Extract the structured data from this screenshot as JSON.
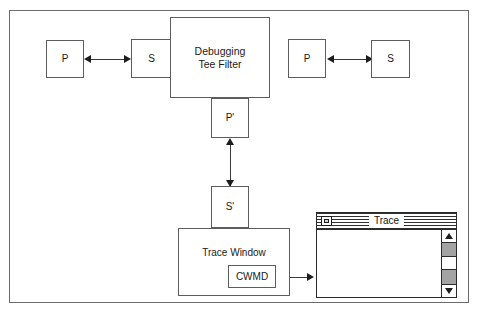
{
  "diagram": {
    "nodes": {
      "client_proxy": {
        "label": "P"
      },
      "client_stub": {
        "label": "S"
      },
      "tee_filter": {
        "line1": "Debugging",
        "line2": "Tee Filter"
      },
      "server_proxy": {
        "label": "P"
      },
      "server_stub": {
        "label": "S"
      },
      "trace_proxy": {
        "label": "P'"
      },
      "trace_stub": {
        "label": "S'"
      },
      "trace_window": {
        "label": "Trace Window"
      },
      "cwmd": {
        "label": "CWMD"
      }
    },
    "connectors": [
      {
        "name": "p-to-s-left",
        "kind": "double-arrow",
        "orientation": "horizontal"
      },
      {
        "name": "p-to-s-right",
        "kind": "double-arrow",
        "orientation": "horizontal"
      },
      {
        "name": "pprime-to-sprime",
        "kind": "double-arrow",
        "orientation": "vertical"
      },
      {
        "name": "cwmd-to-trace",
        "kind": "single-arrow",
        "orientation": "horizontal"
      }
    ],
    "colors": {
      "frame": "#6b6b6b",
      "box_border": "#5d5d5d",
      "line": "#3a3a3a",
      "arrow": "#1d1d1d",
      "background": "#ffffff",
      "scroll_track": "#a3a3a3",
      "titlebar_stripe": "#2f2f2f"
    }
  },
  "trace_window": {
    "title": "Trace",
    "close_box_icon": "close-box-icon",
    "scrollbar": {
      "up_arrow_icon": "scroll-up-arrow-icon",
      "down_arrow_icon": "scroll-down-arrow-icon"
    }
  }
}
